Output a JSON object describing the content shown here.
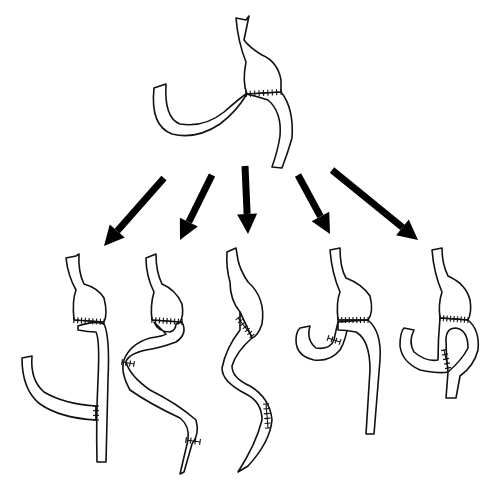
{
  "diagram": {
    "title": "",
    "background": "#ffffff",
    "stroke_color": "#111111",
    "arrow_color": "#000000",
    "source_figure": {
      "name": "original-reconstruction",
      "esophagus": "M236,18 L246,20 L249,16 L244,40 Q250,48 262,55 Q278,62 281,80 L281,92 L247,94 Q242,82 246,62 Q238,42 236,18 Z",
      "stomach_pouch": "M244,60 Q236,70 240,84 L246,94 L281,92 Q284,72 276,62 Q262,52 244,60 Z",
      "limb_outer": "M247,94 Q236,112 220,124 Q196,140 172,134 Q150,126 154,88 L166,84 Q164,118 180,124 Q204,128 224,112 Q240,98 246,94",
      "limb_right": "M281,92 Q294,108 292,138 Q288,152 282,168 L272,167 Q278,150 280,136 Q282,112 268,100 Q256,96 246,94",
      "suture_line": {
        "x1": 246,
        "y1": 94,
        "x2": 281,
        "y2": 92,
        "ticks": 8
      }
    },
    "arrows": [
      {
        "name": "arrow-1",
        "x1": 164,
        "y1": 178,
        "x2": 104,
        "y2": 246
      },
      {
        "name": "arrow-2",
        "x1": 212,
        "y1": 175,
        "x2": 180,
        "y2": 240
      },
      {
        "name": "arrow-3",
        "x1": 245,
        "y1": 166,
        "x2": 248,
        "y2": 234
      },
      {
        "name": "arrow-4",
        "x1": 298,
        "y1": 175,
        "x2": 330,
        "y2": 234
      },
      {
        "name": "arrow-5",
        "x1": 332,
        "y1": 170,
        "x2": 418,
        "y2": 240
      }
    ],
    "variants": [
      {
        "name": "variant-1-roux-en-y",
        "esophagus": "M66,258 L76,256 L79,254 Q78,272 84,284 Q98,288 104,298 Q108,314 104,322 L74,320 Q72,300 76,290 Q68,276 66,258 Z",
        "jejunum_vertical": "M78,326 Q96,320 104,324 Q110,336 108,380 L106,462 L97,462 Q96,420 98,380 Q100,340 96,332 Q88,332 78,330 Z",
        "roux_limb": "M22,358 L32,356 Q30,380 44,392 Q64,404 96,406 L96,420 Q60,418 40,404 Q22,390 22,358 Z",
        "sutures": [
          {
            "x1": 74,
            "y1": 320,
            "x2": 104,
            "y2": 322,
            "ticks": 8
          },
          {
            "x1": 96,
            "y1": 406,
            "x2": 96,
            "y2": 420,
            "ticks": 3
          }
        ]
      },
      {
        "name": "variant-2-loop",
        "esophagus": "M146,258 L156,254 Q156,272 162,284 Q176,290 182,304 Q184,316 180,322 L152,320 Q150,306 154,292 Q146,276 146,258 Z",
        "loop_limb": "M154,322 Q158,332 170,332 Q176,330 176,324 L182,322 Q188,334 176,342 Q160,348 146,350 Q128,354 126,362 Q130,376 150,390 Q178,404 196,420 Q200,434 192,444 L184,472 L180,474 L188,440 Q190,426 180,418 Q150,404 130,390 Q120,372 124,360 Q130,344 150,338 Q164,336 166,334 Z",
        "sutures": [
          {
            "x1": 152,
            "y1": 320,
            "x2": 182,
            "y2": 322,
            "ticks": 8
          },
          {
            "x1": 122,
            "y1": 362,
            "x2": 134,
            "y2": 364,
            "ticks": 3
          },
          {
            "x1": 186,
            "y1": 440,
            "x2": 200,
            "y2": 442,
            "ticks": 3
          }
        ]
      },
      {
        "name": "variant-3-tube",
        "stomach": "M227,252 L236,248 L238,260 Q240,270 248,282 Q266,298 262,324 Q258,336 252,338 L240,312 Q230,300 230,282 Q226,268 227,252 Z",
        "limb": "M240,312 L252,338 Q236,352 232,366 Q232,378 250,386 Q270,398 272,420 Q270,442 248,466 L238,472 Q256,444 262,420 Q262,402 246,394 Q222,382 222,368 Q226,348 240,330 Z",
        "sutures": [
          {
            "x1": 238,
            "y1": 318,
            "x2": 252,
            "y2": 336,
            "ticks": 6
          },
          {
            "x1": 266,
            "y1": 404,
            "x2": 268,
            "y2": 428,
            "ticks": 5
          }
        ]
      },
      {
        "name": "variant-4-billroth-loop",
        "esophagus": "M330,250 L340,248 Q340,268 346,278 Q362,284 370,296 Q374,312 368,320 L338,320 Q336,302 340,292 Q332,274 330,250 Z",
        "afferent": "M300,328 L310,326 Q306,340 316,348 Q330,350 334,340 Q336,330 338,322 L348,324 Q346,340 340,350 Q330,362 314,360 Q296,356 296,340 Q296,332 300,328 Z",
        "efferent": "M338,322 L368,320 Q382,332 380,360 L374,434 L366,434 L370,370 Q370,340 356,332 Q346,330 338,330 Z",
        "sutures": [
          {
            "x1": 338,
            "y1": 320,
            "x2": 368,
            "y2": 320,
            "ticks": 8
          },
          {
            "x1": 328,
            "y1": 338,
            "x2": 340,
            "y2": 342,
            "ticks": 3
          }
        ]
      },
      {
        "name": "variant-5-twisted-loop",
        "esophagus": "M432,250 L442,248 Q442,264 448,276 Q466,284 470,300 Q472,312 468,320 L440,318 Q438,304 442,292 Q434,274 432,250 Z",
        "loop": "M440,318 L468,320 Q480,330 478,350 Q474,366 460,376 L456,398 L446,398 L448,372 Q462,360 468,348 Q468,330 456,328 Q446,328 446,340 Q446,356 448,372 Q440,374 420,370 Q402,362 400,346 Q400,332 404,328 L414,330 Q408,342 414,352 Q426,362 438,360 Q438,340 440,318 Z",
        "sutures": [
          {
            "x1": 440,
            "y1": 318,
            "x2": 468,
            "y2": 320,
            "ticks": 8
          },
          {
            "x1": 444,
            "y1": 350,
            "x2": 448,
            "y2": 368,
            "ticks": 4
          }
        ]
      }
    ]
  }
}
